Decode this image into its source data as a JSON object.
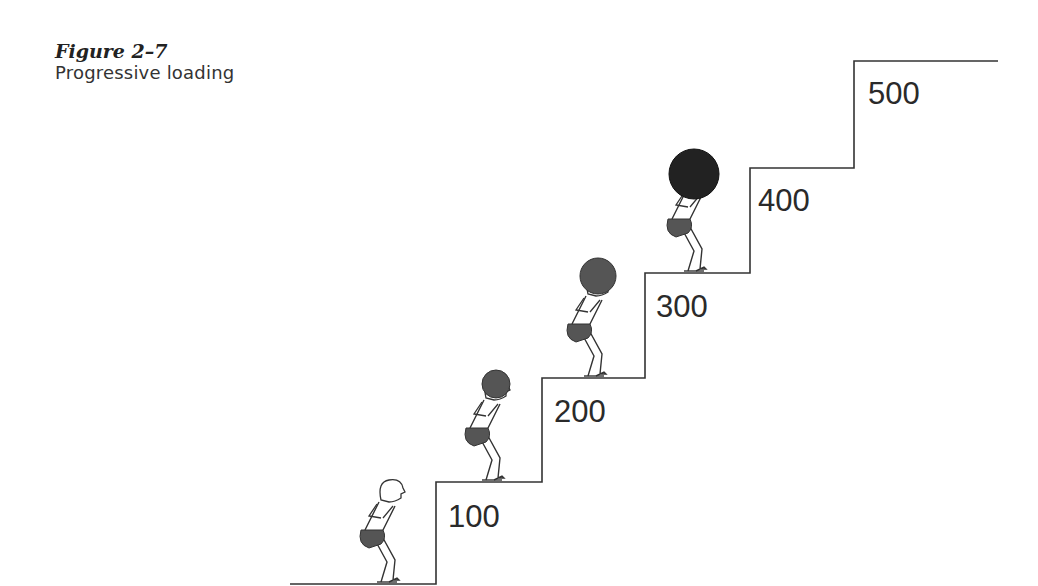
{
  "figure": {
    "number": "Figure 2–7",
    "title": "Progressive loading"
  },
  "steps": [
    {
      "label": "100"
    },
    {
      "label": "200"
    },
    {
      "label": "300"
    },
    {
      "label": "400"
    },
    {
      "label": "500"
    }
  ],
  "figures": [
    {
      "step": "ground",
      "ball": "none"
    },
    {
      "step": "100",
      "ball": "small"
    },
    {
      "step": "200",
      "ball": "medium"
    },
    {
      "step": "300",
      "ball": "large"
    }
  ],
  "colors": {
    "line": "#333333",
    "ball_medium": "#555555",
    "ball_large": "#222222",
    "shorts": "#555555"
  }
}
